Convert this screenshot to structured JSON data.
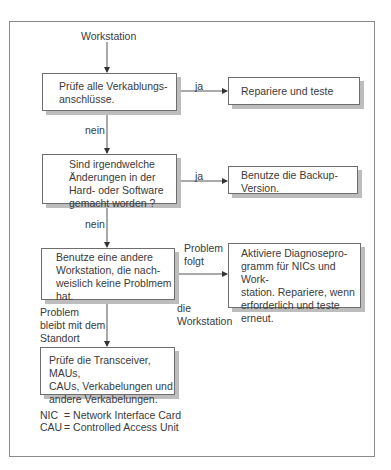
{
  "diagram": {
    "start_label": "Workstation",
    "nodes": [
      {
        "id": "check_cabling",
        "text": "Prüfe alle Verkablungs-\nanschlüsse."
      },
      {
        "id": "repair_test",
        "text": "Repariere und teste"
      },
      {
        "id": "changes_made",
        "text": "Sind irgendwelche\nÄnderungen in der\nHard- oder Software\ngemacht worden ?"
      },
      {
        "id": "use_backup",
        "text": "Benutze die Backup-\nVersion."
      },
      {
        "id": "other_workstation",
        "text": "Benutze eine andere\nWorkstation, die nach-\nweislich keine Problmem\nhat."
      },
      {
        "id": "run_diagnostics",
        "text": "Aktiviere Diagnosepro-\ngramm für NICs und Work-\nstation. Repariere, wenn\nerforderlich und teste\nerneut."
      },
      {
        "id": "check_transceivers",
        "text": "Prüfe die Transceiver, MAUs,\nCAUs, Verkabelungen und\nandere Verkabelungen."
      }
    ],
    "edge_labels": {
      "yes_1": "ja",
      "no_1": "nein",
      "yes_2": "ja",
      "no_2": "nein",
      "problem_follows": "Problem\nfolgt",
      "the_workstation": "die\nWorkstation",
      "problem_stays": "Problem\nbleibt mit dem\nStandort"
    },
    "edges": [
      {
        "from": "start",
        "to": "check_cabling"
      },
      {
        "from": "check_cabling",
        "to": "repair_test",
        "label": "ja"
      },
      {
        "from": "check_cabling",
        "to": "changes_made",
        "label": "nein"
      },
      {
        "from": "changes_made",
        "to": "use_backup",
        "label": "ja"
      },
      {
        "from": "changes_made",
        "to": "other_workstation",
        "label": "nein"
      },
      {
        "from": "other_workstation",
        "to": "run_diagnostics",
        "label": "Problem folgt die Workstation"
      },
      {
        "from": "other_workstation",
        "to": "check_transceivers",
        "label": "Problem bleibt mit dem Standort"
      }
    ],
    "legend": [
      {
        "abbr": "NIC",
        "meaning": "= Network Interface Card"
      },
      {
        "abbr": "CAU",
        "meaning": "= Controlled Access Unit"
      }
    ]
  }
}
